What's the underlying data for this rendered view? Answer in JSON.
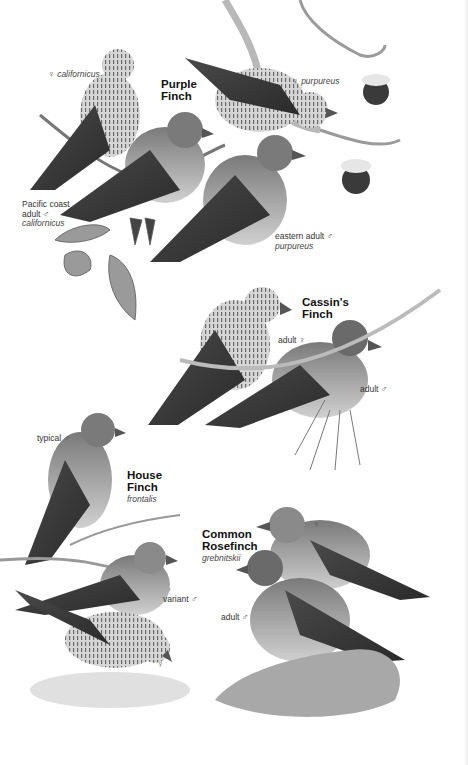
{
  "plate": {
    "species": [
      {
        "name_line1": "Purple",
        "name_line2": "Finch",
        "labels": [
          {
            "sex_symbol": "♀",
            "text": "californicus"
          },
          {
            "sex_symbol": "♀",
            "text": "purpureus"
          },
          {
            "line1": "Pacific coast",
            "line2": "adult",
            "sex_symbol": "♂",
            "line3": "californicus"
          },
          {
            "line1": "eastern adult",
            "sex_symbol": "♂",
            "line2": "purpureus"
          }
        ]
      },
      {
        "name_line1": "Cassin's",
        "name_line2": "Finch",
        "labels": [
          {
            "text": "adult",
            "sex_symbol": "♀"
          },
          {
            "text": "adult",
            "sex_symbol": "♂"
          }
        ]
      },
      {
        "name_line1": "House",
        "name_line2": "Finch",
        "subspecies": "frontalis",
        "labels": [
          {
            "text": "typical",
            "sex_symbol": "♂"
          },
          {
            "text": "variant",
            "sex_symbol": "♂"
          },
          {
            "text": "",
            "sex_symbol": "♀"
          }
        ]
      },
      {
        "name_line1": "Common",
        "name_line2": "Rosefinch",
        "subspecies": "grebnitskii",
        "labels": [
          {
            "text": "",
            "sex_symbol": "♀"
          },
          {
            "text": "adult",
            "sex_symbol": "♂"
          }
        ]
      }
    ],
    "colors": {
      "background": "#ffffff",
      "ink": "#1a1a1a",
      "bird_dark": "#3a3a3a",
      "bird_mid": "#8a8a8a",
      "bird_light": "#c8c8c8"
    }
  }
}
